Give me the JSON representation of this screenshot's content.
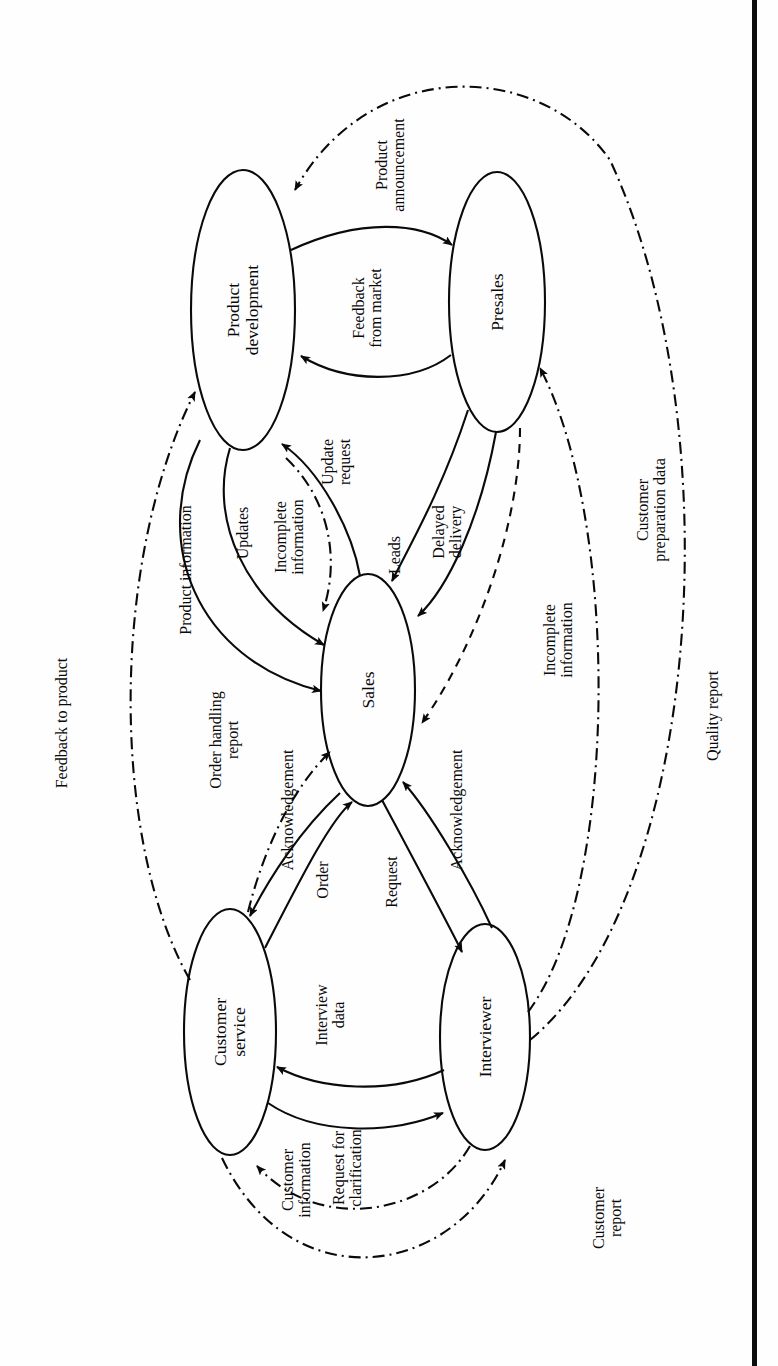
{
  "figure": {
    "type": "process-interaction-diagram",
    "orientation": "rotated-90-ccw",
    "title": "",
    "caption": "",
    "page_edge_artifact": true
  },
  "nodes": [
    {
      "id": "product-development",
      "label": "Product\ndevelopment",
      "cx": 243,
      "cy": 310,
      "rx": 52,
      "ry": 140
    },
    {
      "id": "presales",
      "label": "Presales",
      "cx": 497,
      "cy": 302,
      "rx": 48,
      "ry": 130
    },
    {
      "id": "sales",
      "label": "Sales",
      "cx": 368,
      "cy": 690,
      "rx": 47,
      "ry": 116
    },
    {
      "id": "customer-service",
      "label": "Customer\nservice",
      "cx": 230,
      "cy": 1032,
      "rx": 46,
      "ry": 123
    },
    {
      "id": "interviewer",
      "label": "Interviewer",
      "cx": 485,
      "cy": 1037,
      "rx": 45,
      "ry": 113
    }
  ],
  "edges": [
    {
      "id": "feedback-from-market",
      "label": "Feedback\nfrom market",
      "from": "presales",
      "to": "product-development",
      "style": "solid"
    },
    {
      "id": "product-announcement",
      "label": "Product\nannouncement",
      "from": "product-development",
      "to": "presales",
      "style": "solid"
    },
    {
      "id": "update-request",
      "label": "Update\nrequest",
      "from": "sales",
      "to": "product-development",
      "style": "solid"
    },
    {
      "id": "updates",
      "label": "Updates",
      "from": "product-development",
      "to": "sales",
      "style": "solid"
    },
    {
      "id": "product-information",
      "label": "Product information",
      "from": "product-development",
      "to": "sales",
      "style": "solid"
    },
    {
      "id": "incomplete-information-pd",
      "label": "Incomplete\ninformation",
      "from": "sales",
      "to": "product-development",
      "style": "dash-dot"
    },
    {
      "id": "leads",
      "label": "Leads",
      "from": "presales",
      "to": "sales",
      "style": "solid"
    },
    {
      "id": "delayed-delivery",
      "label": "Delayed\ndelivery",
      "from": "presales",
      "to": "sales",
      "style": "solid"
    },
    {
      "id": "incomplete-information-ps",
      "label": "Incomplete\ninformation",
      "from": "presales",
      "to": "sales",
      "style": "dashed"
    },
    {
      "id": "order",
      "label": "Order",
      "from": "customer-service",
      "to": "sales",
      "style": "solid"
    },
    {
      "id": "acknowledgement-cs",
      "label": "Acknowledgement",
      "from": "sales",
      "to": "customer-service",
      "style": "solid"
    },
    {
      "id": "request",
      "label": "Request",
      "from": "sales",
      "to": "interviewer",
      "style": "solid"
    },
    {
      "id": "acknowledgement-iv",
      "label": "Acknowledgement",
      "from": "interviewer",
      "to": "sales",
      "style": "solid"
    },
    {
      "id": "order-handling-report",
      "label": "Order handling\nreport",
      "from": "customer-service",
      "to": "sales",
      "style": "dash-dot"
    },
    {
      "id": "interview-data",
      "label": "Interview\ndata",
      "from": "interviewer",
      "to": "customer-service",
      "style": "solid"
    },
    {
      "id": "request-for-clarification",
      "label": "Request for\nclarification",
      "from": "customer-service",
      "to": "interviewer",
      "style": "solid"
    },
    {
      "id": "customer-information",
      "label": "Customer\ninformation",
      "from": "interviewer",
      "to": "customer-service",
      "style": "dash-dot"
    },
    {
      "id": "customer-report",
      "label": "Customer\nreport",
      "from": "customer-service",
      "to": "interviewer",
      "style": "dash-dot"
    },
    {
      "id": "feedback-to-product",
      "label": "Feedback to product",
      "from": "customer-service",
      "to": "product-development",
      "style": "dash-dot"
    },
    {
      "id": "customer-preparation-data",
      "label": "Customer\npreparation data",
      "from": "interviewer",
      "to": "presales",
      "style": "dash-dot"
    },
    {
      "id": "quality-report",
      "label": "Quality report",
      "from": "interviewer",
      "to": "product-development",
      "style": "dash-dot"
    }
  ],
  "labels": {
    "product_development": "Product\ndevelopment",
    "presales": "Presales",
    "sales": "Sales",
    "customer_service": "Customer\nservice",
    "interviewer": "Interviewer",
    "feedback_from_market": "Feedback\nfrom market",
    "product_announcement": "Product\nannouncement",
    "update_request": "Update\nrequest",
    "updates": "Updates",
    "product_information": "Product information",
    "incomplete_information_a": "Incomplete\ninformation",
    "incomplete_information_b": "Incomplete\ninformation",
    "leads": "Leads",
    "delayed_delivery": "Delayed\ndelivery",
    "order": "Order",
    "acknowledgement_a": "Acknowledgement",
    "acknowledgement_b": "Acknowledgement",
    "request": "Request",
    "order_handling_report": "Order handling\nreport",
    "interview_data": "Interview\ndata",
    "request_for_clarification": "Request for\nclarification",
    "customer_information": "Customer\ninformation",
    "customer_report": "Customer\nreport",
    "feedback_to_product": "Feedback to product",
    "customer_preparation_data": "Customer\npreparation data",
    "quality_report": "Quality report"
  },
  "colors": {
    "ink": "#0a0a0a",
    "paper": "#ffffff",
    "scan_edge": "#0d0d0d"
  }
}
